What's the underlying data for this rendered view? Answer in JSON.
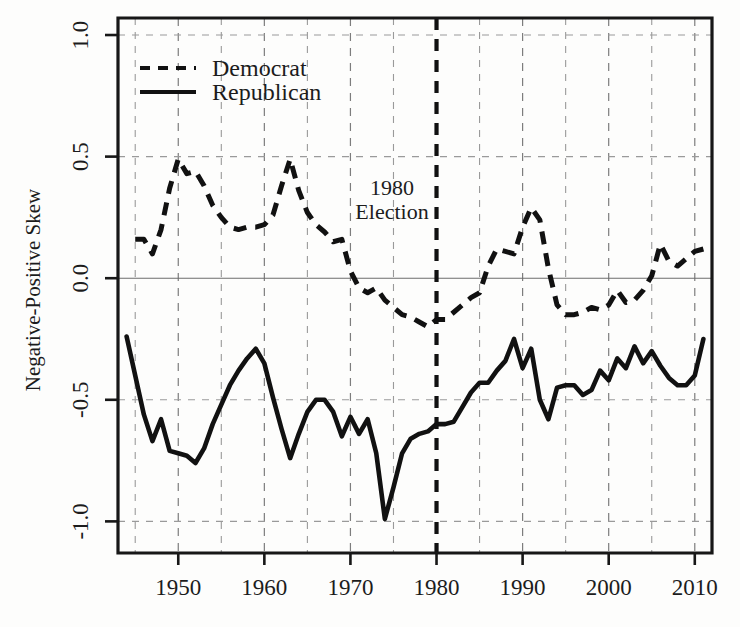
{
  "figure": {
    "title": "",
    "ylabel": "Negative-Positive Skew",
    "xlabel": ""
  },
  "legend": {
    "position": "top-left-inside",
    "items": [
      {
        "label": "Democrat",
        "style": "dashed"
      },
      {
        "label": "Republican",
        "style": "solid"
      }
    ]
  },
  "annotation": {
    "line1": "1980",
    "line2": "Election",
    "at_x": 1980
  },
  "axis": {
    "y_ticks": [
      "1.0",
      "0.5",
      "0.0",
      "-0.5",
      "-1.0"
    ],
    "y_tick_values": [
      1.0,
      0.5,
      0.0,
      -0.5,
      -1.0
    ],
    "x_ticks": [
      "1950",
      "1960",
      "1970",
      "1980",
      "1990",
      "2000",
      "2010"
    ],
    "x_tick_values": [
      1950,
      1960,
      1970,
      1980,
      1990,
      2000,
      2010
    ],
    "x_minor_values": [
      1945,
      1955,
      1965,
      1975,
      1985,
      1995,
      2005
    ],
    "xlim": [
      1943,
      2012
    ],
    "ylim": [
      -1.13,
      1.07
    ]
  },
  "chart_data": {
    "type": "line",
    "title": "",
    "xlabel": "",
    "ylabel": "Negative-Positive Skew",
    "xlim": [
      1943,
      2012
    ],
    "ylim": [
      -1.13,
      1.07
    ],
    "grid": true,
    "legend": "top-left",
    "annotations": [
      {
        "text": "1980 Election",
        "x": 1980,
        "type": "vertical-dashed-line"
      }
    ],
    "series": [
      {
        "name": "Democrat",
        "style": "dashed",
        "color": "#111111",
        "x": [
          1945,
          1946,
          1947,
          1948,
          1949,
          1950,
          1951,
          1952,
          1953,
          1954,
          1955,
          1956,
          1957,
          1958,
          1959,
          1960,
          1961,
          1962,
          1963,
          1964,
          1965,
          1966,
          1967,
          1968,
          1969,
          1970,
          1971,
          1972,
          1973,
          1974,
          1975,
          1976,
          1977,
          1978,
          1979,
          1980,
          1981,
          1982,
          1983,
          1984,
          1985,
          1986,
          1987,
          1988,
          1989,
          1990,
          1991,
          1992,
          1993,
          1994,
          1995,
          1996,
          1997,
          1998,
          1999,
          2000,
          2001,
          2002,
          2003,
          2004,
          2005,
          2006,
          2007,
          2008,
          2009,
          2010,
          2011
        ],
        "y": [
          0.16,
          0.16,
          0.1,
          0.2,
          0.37,
          0.49,
          0.43,
          0.44,
          0.38,
          0.3,
          0.25,
          0.21,
          0.2,
          0.21,
          0.21,
          0.22,
          0.26,
          0.38,
          0.49,
          0.36,
          0.27,
          0.22,
          0.19,
          0.15,
          0.16,
          0.03,
          -0.04,
          -0.06,
          -0.04,
          -0.09,
          -0.12,
          -0.15,
          -0.16,
          -0.18,
          -0.2,
          -0.17,
          -0.17,
          -0.14,
          -0.11,
          -0.08,
          -0.06,
          0.05,
          0.12,
          0.11,
          0.1,
          0.21,
          0.29,
          0.24,
          0.04,
          -0.11,
          -0.15,
          -0.15,
          -0.14,
          -0.12,
          -0.13,
          -0.11,
          -0.05,
          -0.1,
          -0.09,
          -0.05,
          0.01,
          0.14,
          0.07,
          0.05,
          0.08,
          0.11,
          0.12
        ]
      },
      {
        "name": "Republican",
        "style": "solid",
        "color": "#111111",
        "x": [
          1944,
          1945,
          1946,
          1947,
          1948,
          1949,
          1950,
          1951,
          1952,
          1953,
          1954,
          1955,
          1956,
          1957,
          1958,
          1959,
          1960,
          1961,
          1962,
          1963,
          1964,
          1965,
          1966,
          1967,
          1968,
          1969,
          1970,
          1971,
          1972,
          1973,
          1974,
          1975,
          1976,
          1977,
          1978,
          1979,
          1980,
          1981,
          1982,
          1983,
          1984,
          1985,
          1986,
          1987,
          1988,
          1989,
          1990,
          1991,
          1992,
          1993,
          1994,
          1995,
          1996,
          1997,
          1998,
          1999,
          2000,
          2001,
          2002,
          2003,
          2004,
          2005,
          2006,
          2007,
          2008,
          2009,
          2010,
          2011
        ],
        "y": [
          -0.24,
          -0.4,
          -0.56,
          -0.67,
          -0.58,
          -0.71,
          -0.72,
          -0.73,
          -0.76,
          -0.7,
          -0.6,
          -0.52,
          -0.44,
          -0.38,
          -0.33,
          -0.29,
          -0.35,
          -0.49,
          -0.62,
          -0.74,
          -0.64,
          -0.55,
          -0.5,
          -0.5,
          -0.55,
          -0.65,
          -0.57,
          -0.64,
          -0.58,
          -0.72,
          -0.99,
          -0.86,
          -0.72,
          -0.66,
          -0.64,
          -0.63,
          -0.6,
          -0.6,
          -0.59,
          -0.53,
          -0.47,
          -0.43,
          -0.43,
          -0.38,
          -0.34,
          -0.25,
          -0.37,
          -0.29,
          -0.5,
          -0.58,
          -0.45,
          -0.44,
          -0.44,
          -0.48,
          -0.46,
          -0.38,
          -0.42,
          -0.33,
          -0.37,
          -0.28,
          -0.35,
          -0.3,
          -0.36,
          -0.41,
          -0.44,
          -0.44,
          -0.4,
          -0.25
        ]
      }
    ]
  }
}
